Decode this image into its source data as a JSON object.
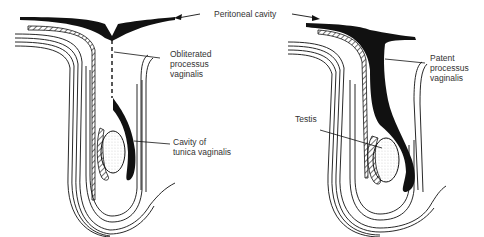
{
  "diagram": {
    "type": "anatomical-illustration",
    "panels": [
      {
        "id": "left",
        "description": "Normal descent with obliterated processus vaginalis",
        "labels": {
          "processus": "Obliterated\nprocessus\nvaginalis",
          "cavity": "Cavity of\ntunica vaginalis"
        }
      },
      {
        "id": "right",
        "description": "Patent processus vaginalis",
        "labels": {
          "processus": "Patent\nprocessus\nvaginalis",
          "testis": "Testis"
        }
      }
    ],
    "shared_label": "Peritoneal cavity",
    "colors": {
      "ink": "#111111",
      "background": "#ffffff",
      "text": "#333333"
    }
  }
}
